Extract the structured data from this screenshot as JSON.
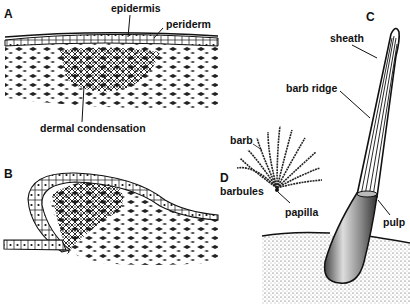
{
  "figure": {
    "panels": [
      {
        "id": "A",
        "letter": "A",
        "labels": [
          "epidermis",
          "periderm",
          "dermal condensation"
        ]
      },
      {
        "id": "B",
        "letter": "B",
        "labels": []
      },
      {
        "id": "C",
        "letter": "C",
        "labels": [
          "sheath",
          "barb ridge",
          "pulp"
        ]
      },
      {
        "id": "D",
        "letter": "D",
        "labels": [
          "barb",
          "barbules",
          "papilla"
        ]
      }
    ],
    "labels": {
      "panel_a": "A",
      "panel_b": "B",
      "panel_c": "C",
      "panel_d": "D",
      "epidermis": "epidermis",
      "periderm": "periderm",
      "dermal_condensation": "dermal condensation",
      "sheath": "sheath",
      "barb_ridge": "barb ridge",
      "pulp": "pulp",
      "barb": "barb",
      "barbules": "barbules",
      "papilla": "papilla"
    },
    "colors": {
      "ink": "#111111",
      "background": "#ffffff"
    }
  }
}
